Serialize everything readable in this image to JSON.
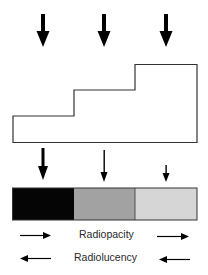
{
  "diagram": {
    "incident_beams": [
      {
        "id": "beam-1",
        "strength": "full"
      },
      {
        "id": "beam-2",
        "strength": "full"
      },
      {
        "id": "beam-3",
        "strength": "full"
      }
    ],
    "step_wedge": {
      "steps": [
        "thin",
        "medium",
        "thick"
      ]
    },
    "transmitted_beams": [
      {
        "id": "transmitted-1",
        "strength": "strong"
      },
      {
        "id": "transmitted-2",
        "strength": "medium"
      },
      {
        "id": "transmitted-3",
        "strength": "weak"
      }
    ],
    "film_segments": [
      {
        "id": "segment-1",
        "color": "#050505"
      },
      {
        "id": "segment-2",
        "color": "#a2a2a2"
      },
      {
        "id": "segment-3",
        "color": "#d6d6d6"
      }
    ],
    "labels": {
      "radiopacity": "Radiopacity",
      "radiolucency": "Radiolucency"
    }
  }
}
